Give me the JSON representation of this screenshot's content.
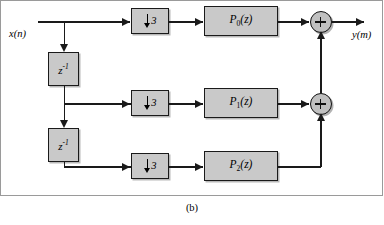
{
  "figure": {
    "caption": "(b)"
  },
  "signals": {
    "input_label": "x(n)",
    "output_label": "y(m)"
  },
  "delays": [
    {
      "name": "delay-1",
      "base": "z",
      "exponent": "-1"
    },
    {
      "name": "delay-2",
      "base": "z",
      "exponent": "-1"
    }
  ],
  "downsamplers": [
    {
      "name": "downsampler-0",
      "factor": "3",
      "direction": "down"
    },
    {
      "name": "downsampler-1",
      "factor": "3",
      "direction": "down"
    },
    {
      "name": "downsampler-2",
      "factor": "3",
      "direction": "down"
    }
  ],
  "filters": [
    {
      "name": "filter-0",
      "base": "P",
      "subscript": "0",
      "arg": "(z)"
    },
    {
      "name": "filter-1",
      "base": "P",
      "subscript": "1",
      "arg": "(z)"
    },
    {
      "name": "filter-2",
      "base": "P",
      "subscript": "2",
      "arg": "(z)"
    }
  ],
  "adders": [
    {
      "name": "adder-1",
      "symbol": "+"
    },
    {
      "name": "adder-2",
      "symbol": "+"
    }
  ],
  "colors": {
    "block_fill": "#c9c9c9",
    "adder_fill": "#c0c0c0",
    "line": "#1a1a1a",
    "frame": "#9a9a9a",
    "background": "#ffffff"
  }
}
